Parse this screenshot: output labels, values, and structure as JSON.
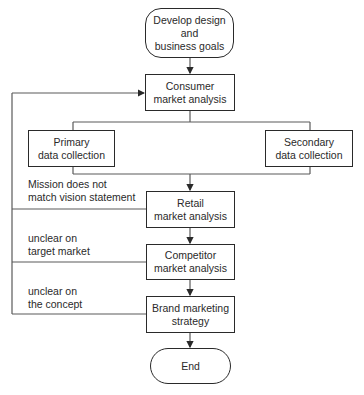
{
  "nodes": {
    "start": {
      "lines": [
        "Develop design",
        "and",
        "business goals"
      ]
    },
    "consumer": {
      "lines": [
        "Consumer",
        "market analysis"
      ]
    },
    "primary": {
      "lines": [
        "Primary",
        "data collection"
      ]
    },
    "secondary": {
      "lines": [
        "Secondary",
        "data collection"
      ]
    },
    "retail": {
      "lines": [
        "Retail",
        "market analysis"
      ]
    },
    "competitor": {
      "lines": [
        "Competitor",
        "market analysis"
      ]
    },
    "brand": {
      "lines": [
        "Brand marketing",
        "strategy"
      ]
    },
    "end": {
      "lines": [
        "End"
      ]
    }
  },
  "feedback_labels": {
    "retail": [
      "Mission does not",
      "match vision statement"
    ],
    "competitor": [
      "unclear on",
      "target market"
    ],
    "brand": [
      "unclear on",
      "the concept"
    ]
  },
  "colors": {
    "stroke": "#2a2a2a",
    "line": "#5a5a5a",
    "background": "#ffffff"
  }
}
